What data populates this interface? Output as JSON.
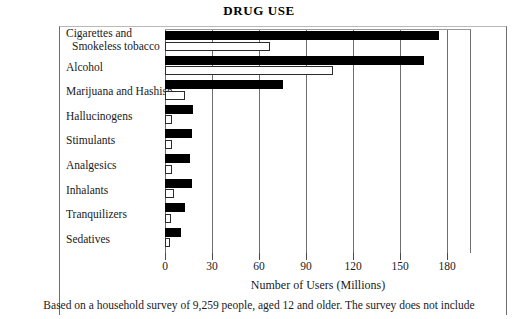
{
  "chart_data": {
    "type": "bar",
    "orientation": "horizontal",
    "title": "DRUG USE",
    "xlabel": "Number of Users (Millions)",
    "ylabel": "",
    "xlim": [
      0,
      195
    ],
    "xticks": [
      0,
      30,
      60,
      90,
      120,
      150,
      180
    ],
    "xtick_labels": [
      "0",
      "30",
      "60",
      "90",
      "120",
      "150",
      "180"
    ],
    "grid": true,
    "legend": "none",
    "categories": [
      "Cigarettes and Smokeless tobacco",
      "Alcohol",
      "Marijuana and Hashish",
      "Hallucinogens",
      "Stimulants",
      "Analgesics",
      "Inhalants",
      "Tranquilizers",
      "Sedatives"
    ],
    "series": [
      {
        "name": "solid",
        "style": "filled-black",
        "values": [
          175,
          165,
          75,
          18,
          17,
          16,
          17,
          13,
          10
        ]
      },
      {
        "name": "hollow",
        "style": "outlined-white",
        "values": [
          67,
          107,
          13,
          4.5,
          4.5,
          4.5,
          5.5,
          4,
          3
        ]
      }
    ],
    "caption": "Based on a household survey of 9,259 people, aged 12 and older. The survey does not include"
  },
  "chart": {
    "title": "DRUG USE",
    "x_axis_title": "Number of Users (Millions)",
    "caption": "Based on a household survey of 9,259 people, aged 12 and older. The survey does not include",
    "ticks": [
      {
        "label": "0",
        "value": 0
      },
      {
        "label": "30",
        "value": 30
      },
      {
        "label": "60",
        "value": 60
      },
      {
        "label": "90",
        "value": 90
      },
      {
        "label": "120",
        "value": 120
      },
      {
        "label": "150",
        "value": 150
      },
      {
        "label": "180",
        "value": 180
      }
    ],
    "rows": [
      {
        "label_line1": "Cigarettes and",
        "label_line2": "Smokeless tobacco",
        "solid": 175,
        "hollow": 67
      },
      {
        "label_line1": "Alcohol",
        "label_line2": "",
        "solid": 165,
        "hollow": 107
      },
      {
        "label_line1": "Marijuana and Hashish",
        "label_line2": "",
        "solid": 75,
        "hollow": 13
      },
      {
        "label_line1": "Hallucinogens",
        "label_line2": "",
        "solid": 18,
        "hollow": 4.5
      },
      {
        "label_line1": "Stimulants",
        "label_line2": "",
        "solid": 17,
        "hollow": 4.5
      },
      {
        "label_line1": "Analgesics",
        "label_line2": "",
        "solid": 16,
        "hollow": 4.5
      },
      {
        "label_line1": "Inhalants",
        "label_line2": "",
        "solid": 17,
        "hollow": 5.5
      },
      {
        "label_line1": "Tranquilizers",
        "label_line2": "",
        "solid": 13,
        "hollow": 4
      },
      {
        "label_line1": "Sedatives",
        "label_line2": "",
        "solid": 10,
        "hollow": 3
      }
    ]
  }
}
